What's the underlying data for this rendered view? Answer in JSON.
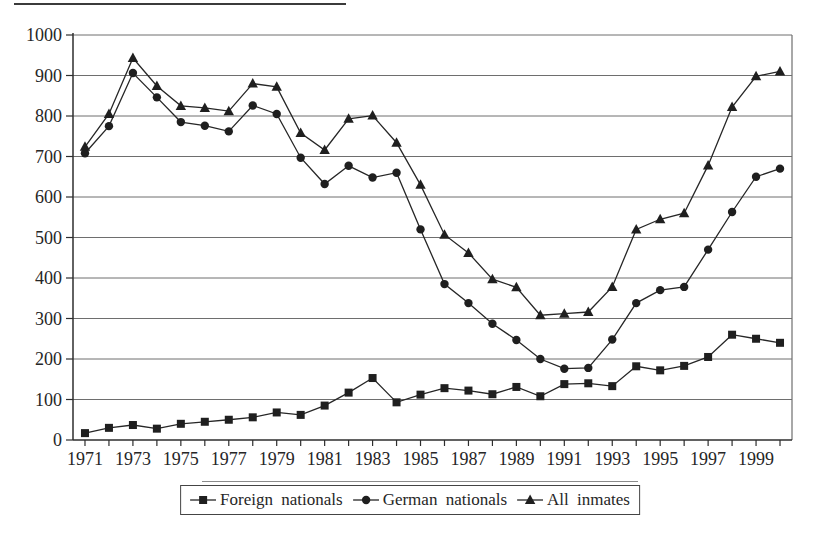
{
  "chart_data": {
    "type": "line",
    "title": "",
    "xlabel": "",
    "ylabel": "",
    "x": [
      1971,
      1972,
      1973,
      1974,
      1975,
      1976,
      1977,
      1978,
      1979,
      1980,
      1981,
      1982,
      1983,
      1984,
      1985,
      1986,
      1987,
      1988,
      1989,
      1990,
      1991,
      1992,
      1993,
      1994,
      1995,
      1996,
      1997,
      1998,
      1999,
      2000
    ],
    "x_tick_labels": [
      "1971",
      "1973",
      "1975",
      "1977",
      "1979",
      "1981",
      "1983",
      "1985",
      "1987",
      "1989",
      "1991",
      "1993",
      "1995",
      "1997",
      "1999"
    ],
    "x_tick_label_step": 2,
    "ylim": [
      0,
      1000
    ],
    "yticks": [
      0,
      100,
      200,
      300,
      400,
      500,
      600,
      700,
      800,
      900,
      1000
    ],
    "grid": "horizontal",
    "legend_position": "bottom-center",
    "series": [
      {
        "name": "Foreign nationals",
        "marker": "square",
        "values": [
          17,
          30,
          37,
          28,
          40,
          45,
          50,
          56,
          68,
          62,
          85,
          117,
          153,
          93,
          112,
          128,
          122,
          113,
          131,
          108,
          138,
          140,
          133,
          182,
          172,
          183,
          205,
          260,
          250,
          240
        ]
      },
      {
        "name": "German nationals",
        "marker": "circle",
        "values": [
          708,
          775,
          906,
          846,
          785,
          776,
          762,
          826,
          805,
          697,
          632,
          677,
          648,
          660,
          520,
          385,
          338,
          287,
          247,
          200,
          176,
          178,
          248,
          338,
          370,
          378,
          470,
          563,
          650,
          670
        ]
      },
      {
        "name": "All inmates",
        "marker": "triangle",
        "values": [
          724,
          805,
          943,
          874,
          825,
          820,
          812,
          880,
          872,
          758,
          716,
          793,
          801,
          734,
          630,
          507,
          462,
          397,
          377,
          308,
          312,
          316,
          378,
          520,
          545,
          560,
          678,
          822,
          898,
          910
        ]
      }
    ],
    "colors": {
      "series_line": "#262626",
      "marker_fill": "#1f1f1f",
      "grid_line": "#6e6e6e",
      "axis_line": "#2e2e2e",
      "text": "#262626",
      "background": "#ffffff",
      "legend_border": "#444444"
    }
  }
}
